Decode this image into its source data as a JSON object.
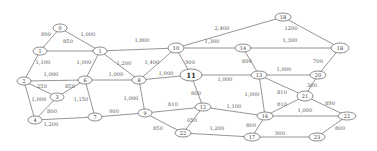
{
  "diagram": {
    "type": "weighted-graph",
    "nodes": [
      {
        "id": "0",
        "label": "0",
        "x": 60,
        "y": 28,
        "rx": 7,
        "ry": 4
      },
      {
        "id": "1",
        "label": "1",
        "x": 40,
        "y": 51,
        "rx": 7,
        "ry": 4
      },
      {
        "id": "2",
        "label": "2",
        "x": 24,
        "y": 81,
        "rx": 7,
        "ry": 4
      },
      {
        "id": "3",
        "label": "3",
        "x": 57,
        "y": 97,
        "rx": 7,
        "ry": 4
      },
      {
        "id": "4",
        "label": "4",
        "x": 35,
        "y": 120,
        "rx": 7,
        "ry": 4
      },
      {
        "id": "5",
        "label": "1",
        "x": 100,
        "y": 51,
        "rx": 7,
        "ry": 4
      },
      {
        "id": "6",
        "label": "6",
        "x": 85,
        "y": 80,
        "rx": 7,
        "ry": 4
      },
      {
        "id": "7",
        "label": "7",
        "x": 95,
        "y": 117,
        "rx": 7,
        "ry": 4
      },
      {
        "id": "8",
        "label": "8",
        "x": 139,
        "y": 80,
        "rx": 7,
        "ry": 4
      },
      {
        "id": "9",
        "label": "9",
        "x": 145,
        "y": 113,
        "rx": 7,
        "ry": 4
      },
      {
        "id": "10",
        "label": "10",
        "x": 176,
        "y": 48,
        "rx": 8,
        "ry": 5
      },
      {
        "id": "11",
        "label": "11",
        "x": 191,
        "y": 75,
        "rx": 11,
        "ry": 6,
        "emphasis": true
      },
      {
        "id": "12",
        "label": "12",
        "x": 203,
        "y": 107,
        "rx": 8,
        "ry": 4
      },
      {
        "id": "13",
        "label": "13",
        "x": 259,
        "y": 75,
        "rx": 8,
        "ry": 4
      },
      {
        "id": "14",
        "label": "14",
        "x": 243,
        "y": 48,
        "rx": 8,
        "ry": 4
      },
      {
        "id": "15",
        "label": "18",
        "x": 283,
        "y": 17,
        "rx": 8,
        "ry": 4
      },
      {
        "id": "16",
        "label": "16",
        "x": 265,
        "y": 116,
        "rx": 8,
        "ry": 4
      },
      {
        "id": "17",
        "label": "17",
        "x": 252,
        "y": 137,
        "rx": 8,
        "ry": 4
      },
      {
        "id": "18",
        "label": "18",
        "x": 340,
        "y": 48,
        "rx": 9,
        "ry": 5
      },
      {
        "id": "19",
        "label": "20",
        "x": 318,
        "y": 75,
        "rx": 8,
        "ry": 4
      },
      {
        "id": "20",
        "label": "21",
        "x": 305,
        "y": 96,
        "rx": 8,
        "ry": 5
      },
      {
        "id": "21",
        "label": "22",
        "x": 347,
        "y": 116,
        "rx": 9,
        "ry": 4
      },
      {
        "id": "22",
        "label": "23",
        "x": 317,
        "y": 137,
        "rx": 8,
        "ry": 4
      },
      {
        "id": "23",
        "label": "22",
        "x": 183,
        "y": 133,
        "rx": 8,
        "ry": 4
      }
    ],
    "edges": [
      {
        "from": "0",
        "to": "1",
        "weight": "890",
        "lx": 46,
        "ly": 34
      },
      {
        "from": "0",
        "to": "5",
        "weight": "1,000",
        "lx": 88,
        "ly": 34
      },
      {
        "from": "1",
        "to": "5",
        "weight": "850",
        "lx": 68,
        "ly": 41
      },
      {
        "from": "1",
        "to": "2",
        "weight": "1,100",
        "lx": 43,
        "ly": 62
      },
      {
        "from": "2",
        "to": "6",
        "weight": "1,000",
        "lx": 51,
        "ly": 74
      },
      {
        "from": "2",
        "to": "3",
        "weight": "250",
        "lx": 42,
        "ly": 86
      },
      {
        "from": "2",
        "to": "4",
        "weight": "1,000",
        "lx": 39,
        "ly": 99
      },
      {
        "from": "3",
        "to": "6",
        "weight": "850",
        "lx": 70,
        "ly": 86
      },
      {
        "from": "3",
        "to": "4",
        "weight": "800",
        "lx": 52,
        "ly": 111
      },
      {
        "from": "4",
        "to": "7",
        "weight": "1,200",
        "lx": 51,
        "ly": 124
      },
      {
        "from": "5",
        "to": "6",
        "weight": "1,000",
        "lx": 84,
        "ly": 62
      },
      {
        "from": "5",
        "to": "8",
        "weight": "1,200",
        "lx": 124,
        "ly": 63
      },
      {
        "from": "5",
        "to": "10",
        "weight": "1,800",
        "lx": 142,
        "ly": 40
      },
      {
        "from": "6",
        "to": "8",
        "weight": "1,000",
        "lx": 116,
        "ly": 74
      },
      {
        "from": "6",
        "to": "7",
        "weight": "1,150",
        "lx": 81,
        "ly": 99
      },
      {
        "from": "7",
        "to": "9",
        "weight": "900",
        "lx": 114,
        "ly": 111
      },
      {
        "from": "8",
        "to": "9",
        "weight": "1,000",
        "lx": 131,
        "ly": 98
      },
      {
        "from": "8",
        "to": "10",
        "weight": "1,400",
        "lx": 152,
        "ly": 62
      },
      {
        "from": "8",
        "to": "11",
        "weight": "1,000",
        "lx": 166,
        "ly": 73
      },
      {
        "from": "9",
        "to": "12",
        "weight": "810",
        "lx": 173,
        "ly": 104
      },
      {
        "from": "9",
        "to": "23",
        "weight": "850",
        "lx": 158,
        "ly": 128
      },
      {
        "from": "10",
        "to": "11",
        "weight": "900",
        "lx": 190,
        "ly": 62
      },
      {
        "from": "10",
        "to": "14",
        "weight": "1,300",
        "lx": 212,
        "ly": 41
      },
      {
        "from": "10",
        "to": "15",
        "weight": "2,400",
        "lx": 222,
        "ly": 28
      },
      {
        "from": "11",
        "to": "12",
        "weight": "800",
        "lx": 196,
        "ly": 93
      },
      {
        "from": "11",
        "to": "13",
        "weight": "1,000",
        "lx": 225,
        "ly": 79
      },
      {
        "from": "12",
        "to": "23",
        "weight": "650",
        "lx": 192,
        "ly": 120
      },
      {
        "from": "12",
        "to": "16",
        "weight": "1,100",
        "lx": 234,
        "ly": 106
      },
      {
        "from": "13",
        "to": "14",
        "weight": "890",
        "lx": 247,
        "ly": 61
      },
      {
        "from": "13",
        "to": "19",
        "weight": "1,000",
        "lx": 284,
        "ly": 69
      },
      {
        "from": "13",
        "to": "16",
        "weight": "1,000",
        "lx": 252,
        "ly": 94
      },
      {
        "from": "13",
        "to": "20",
        "weight": "810",
        "lx": 282,
        "ly": 92
      },
      {
        "from": "14",
        "to": "18",
        "weight": "1,300",
        "lx": 290,
        "ly": 40
      },
      {
        "from": "15",
        "to": "18",
        "weight": "1200",
        "lx": 291,
        "ly": 28
      },
      {
        "from": "16",
        "to": "20",
        "weight": "810",
        "lx": 282,
        "ly": 104
      },
      {
        "from": "16",
        "to": "21",
        "weight": "1,000",
        "lx": 305,
        "ly": 110
      },
      {
        "from": "16",
        "to": "17",
        "weight": "800",
        "lx": 251,
        "ly": 125
      },
      {
        "from": "17",
        "to": "23",
        "weight": "1,200",
        "lx": 217,
        "ly": 128
      },
      {
        "from": "17",
        "to": "22",
        "weight": "900",
        "lx": 280,
        "ly": 133
      },
      {
        "from": "18",
        "to": "19",
        "weight": "700",
        "lx": 318,
        "ly": 61
      },
      {
        "from": "19",
        "to": "20",
        "weight": "300",
        "lx": 312,
        "ly": 85
      },
      {
        "from": "20",
        "to": "21",
        "weight": "890",
        "lx": 330,
        "ly": 103
      },
      {
        "from": "21",
        "to": "22",
        "weight": "800",
        "lx": 340,
        "ly": 128
      }
    ]
  }
}
